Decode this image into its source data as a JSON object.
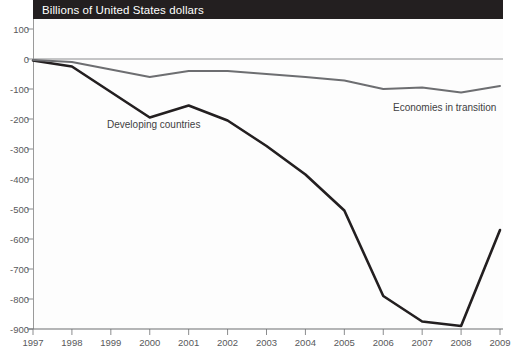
{
  "title": {
    "text": "Billions of United States dollars"
  },
  "chart_data": {
    "type": "line",
    "title": "Billions of United States dollars",
    "xlabel": "",
    "ylabel": "Billions of United States dollars",
    "x": [
      1997,
      1998,
      1999,
      2000,
      2001,
      2002,
      2003,
      2004,
      2005,
      2006,
      2007,
      2008,
      2009
    ],
    "xticklabels": [
      "1997",
      "1998",
      "1999",
      "2000",
      "2001",
      "2002",
      "2003",
      "2004",
      "2005",
      "2006",
      "2007",
      "2008",
      "2009"
    ],
    "yticks": [
      100,
      0,
      -100,
      -200,
      -300,
      -400,
      -500,
      -600,
      -700,
      -800,
      -900
    ],
    "yticklabels": [
      "100",
      "0",
      "-100",
      "-200",
      "-300",
      "-400",
      "-500",
      "-600",
      "-700",
      "-800",
      "-900"
    ],
    "ylim": [
      -900,
      100
    ],
    "xlim": [
      1997,
      2009
    ],
    "grid": false,
    "legend_position": "inline-annotations",
    "series": [
      {
        "name": "Developing countries",
        "color": "#231f20",
        "width": 2.6,
        "values": [
          -5,
          -25,
          -110,
          -195,
          -155,
          -205,
          -290,
          -385,
          -505,
          -790,
          -875,
          -890,
          -570
        ]
      },
      {
        "name": "Economies in transition",
        "color": "#6d6e71",
        "width": 2.0,
        "values": [
          -3,
          -10,
          -35,
          -60,
          -40,
          -40,
          -50,
          -60,
          -72,
          -100,
          -95,
          -112,
          -90
        ]
      }
    ],
    "annotations": [
      {
        "text": "Developing countries",
        "x": 2000.9,
        "y": -230
      },
      {
        "text": "Economies in transition",
        "x": 2006.3,
        "y": -155
      }
    ]
  }
}
